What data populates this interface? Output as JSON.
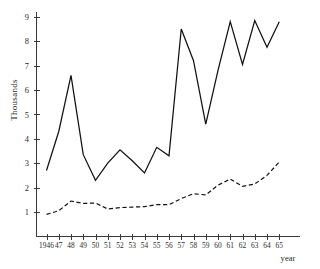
{
  "chart_data": {
    "type": "line",
    "title": "",
    "subtitle": "",
    "xlabel": "year",
    "ylabel": "Thousands",
    "grid": false,
    "legend": "none",
    "xlim": [
      1946,
      1965
    ],
    "ylim": [
      0,
      9.4
    ],
    "yticks": [
      1,
      2,
      3,
      4,
      5,
      6,
      7,
      8,
      9
    ],
    "ytick_labels": [
      "1",
      "2",
      "3",
      "4",
      "5",
      "6",
      "7",
      "8",
      "9"
    ],
    "x": [
      1946,
      1947,
      1948,
      1949,
      1950,
      1951,
      1952,
      1953,
      1954,
      1955,
      1956,
      1957,
      1958,
      1959,
      1960,
      1961,
      1962,
      1963,
      1964,
      1965
    ],
    "xtick_labels": [
      "1946",
      "47",
      "48",
      "49",
      "50",
      "51",
      "52",
      "53",
      "54",
      "55",
      "56",
      "57",
      "58",
      "59",
      "60",
      "61",
      "62",
      "63",
      "64",
      "65"
    ],
    "series": [
      {
        "name": "solid-series",
        "style": "solid",
        "color": "#111111",
        "values": [
          2.7,
          4.3,
          6.6,
          3.35,
          2.3,
          3.0,
          3.55,
          3.1,
          2.6,
          3.65,
          3.3,
          8.5,
          7.2,
          4.6,
          6.8,
          8.8,
          7.05,
          8.85,
          7.75,
          8.8
        ]
      },
      {
        "name": "dashed-series",
        "style": "dashed",
        "color": "#111111",
        "values": [
          0.9,
          1.05,
          1.45,
          1.35,
          1.37,
          1.12,
          1.18,
          1.2,
          1.22,
          1.3,
          1.3,
          1.55,
          1.75,
          1.7,
          2.1,
          2.35,
          2.05,
          2.15,
          2.5,
          3.05
        ]
      }
    ]
  },
  "axes": {
    "y_axis_title": "Thousands",
    "x_axis_title": "year"
  }
}
